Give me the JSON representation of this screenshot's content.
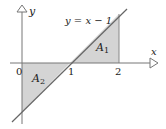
{
  "diagram": {
    "equation_label": "y = x − 1",
    "axes": {
      "x_label": "x",
      "y_label": "y",
      "ticks": [
        "0",
        "1",
        "2"
      ]
    },
    "regions": [
      {
        "label": "A",
        "subscript": "1"
      },
      {
        "label": "A",
        "subscript": "2"
      }
    ],
    "colors": {
      "fill": "#d4d4d4",
      "line": "#666666",
      "axis": "#777777"
    }
  }
}
